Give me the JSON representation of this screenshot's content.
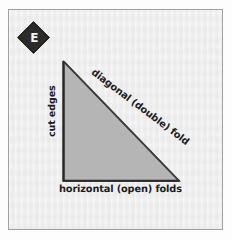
{
  "figure": {
    "panel_letter": "E",
    "badge_icon": "diamond-badge-icon",
    "background_color": "#eeeeee",
    "frame_color": "#9fa0a0",
    "page_color": "#fdfdfd"
  },
  "shape": {
    "name": "right-triangle",
    "fill_color": "#b5b5b5",
    "stroke_color": "#3a3a3a",
    "vertices": {
      "apex": [
        55,
        52
      ],
      "bottom_left": [
        55,
        171
      ],
      "bottom_right": [
        170,
        171
      ]
    }
  },
  "labels": {
    "vertical_leg": "cut edges",
    "hypotenuse": "diagonal (double) fold",
    "base": "horizontal (open) folds"
  }
}
